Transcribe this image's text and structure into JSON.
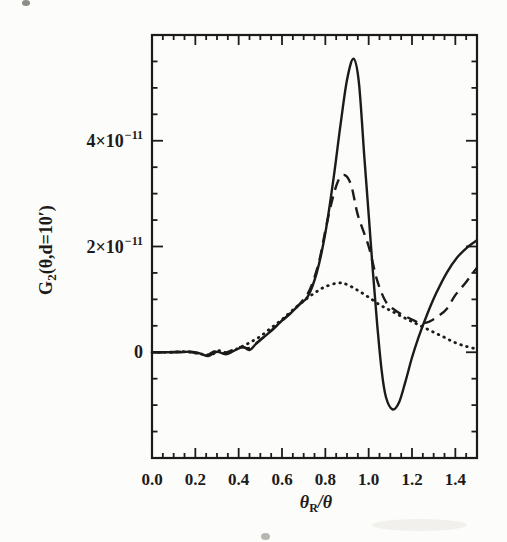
{
  "figure": {
    "background": "#fcfcfa",
    "ink_color": "#1d1b19",
    "width": 507,
    "height": 542
  },
  "chart_data": {
    "type": "line",
    "title": "",
    "xlabel": "θR/θ",
    "xlabel_parts": {
      "base": "θ",
      "sub": "R",
      "rest": "/θ"
    },
    "ylabel": "G2(θ,d=10′)",
    "ylabel_parts": {
      "base": "G",
      "sub": "2",
      "rest": "(θ,d=10′)"
    },
    "xlim": [
      0,
      1.5
    ],
    "ylim": [
      -2e-11,
      6e-11
    ],
    "y_unit_scale": 1e-11,
    "ylim_display_units": [
      -2,
      6
    ],
    "grid": false,
    "legend": "none",
    "frame": "box-with-inward-ticks",
    "x_ticks": {
      "minor_step": 0.05,
      "major_step": 0.2,
      "major": [
        {
          "v": 0.0,
          "text": "0.0"
        },
        {
          "v": 0.2,
          "text": "0.2"
        },
        {
          "v": 0.4,
          "text": "0.4"
        },
        {
          "v": 0.6,
          "text": "0.6"
        },
        {
          "v": 0.8,
          "text": "0.8"
        },
        {
          "v": 1.0,
          "text": "1.0"
        },
        {
          "v": 1.2,
          "text": "1.2"
        },
        {
          "v": 1.4,
          "text": "1.4"
        }
      ]
    },
    "y_ticks": {
      "minor_step_units": 0.5,
      "major": [
        {
          "v": 0,
          "text": "0",
          "sup": ""
        },
        {
          "v": 2,
          "text": "2×10",
          "sup": "−11"
        },
        {
          "v": 4,
          "text": "4×10",
          "sup": "−11"
        }
      ]
    },
    "series": [
      {
        "name": "solid-curve",
        "style": "solid",
        "points_unit": "1e-11",
        "points": [
          [
            0,
            0
          ],
          [
            0.06,
            0
          ],
          [
            0.12,
            0
          ],
          [
            0.18,
            0.01
          ],
          [
            0.22,
            -0.02
          ],
          [
            0.26,
            -0.07
          ],
          [
            0.3,
            0.01
          ],
          [
            0.34,
            -0.04
          ],
          [
            0.38,
            0.03
          ],
          [
            0.42,
            0.1
          ],
          [
            0.45,
            0.04
          ],
          [
            0.48,
            0.16
          ],
          [
            0.52,
            0.3
          ],
          [
            0.56,
            0.44
          ],
          [
            0.6,
            0.6
          ],
          [
            0.64,
            0.74
          ],
          [
            0.68,
            0.9
          ],
          [
            0.72,
            1.06
          ],
          [
            0.76,
            1.5
          ],
          [
            0.8,
            2.25
          ],
          [
            0.84,
            3.35
          ],
          [
            0.87,
            4.3
          ],
          [
            0.9,
            5.15
          ],
          [
            0.93,
            5.55
          ],
          [
            0.955,
            5.1
          ],
          [
            0.98,
            3.7
          ],
          [
            1.0,
            2.6
          ],
          [
            1.02,
            1.5
          ],
          [
            1.04,
            0.5
          ],
          [
            1.06,
            -0.35
          ],
          [
            1.08,
            -0.85
          ],
          [
            1.11,
            -1.08
          ],
          [
            1.14,
            -0.95
          ],
          [
            1.17,
            -0.55
          ],
          [
            1.2,
            -0.1
          ],
          [
            1.23,
            0.28
          ],
          [
            1.27,
            0.72
          ],
          [
            1.31,
            1.1
          ],
          [
            1.36,
            1.5
          ],
          [
            1.41,
            1.8
          ],
          [
            1.46,
            2.0
          ],
          [
            1.5,
            2.12
          ]
        ]
      },
      {
        "name": "dashed-curve",
        "style": "dashed",
        "points_unit": "1e-11",
        "points": [
          [
            0,
            0
          ],
          [
            0.07,
            0
          ],
          [
            0.14,
            0.01
          ],
          [
            0.2,
            -0.01
          ],
          [
            0.25,
            -0.06
          ],
          [
            0.29,
            0.02
          ],
          [
            0.33,
            -0.02
          ],
          [
            0.37,
            0.04
          ],
          [
            0.41,
            0.1
          ],
          [
            0.45,
            0.08
          ],
          [
            0.49,
            0.2
          ],
          [
            0.53,
            0.34
          ],
          [
            0.57,
            0.48
          ],
          [
            0.61,
            0.63
          ],
          [
            0.65,
            0.78
          ],
          [
            0.69,
            0.95
          ],
          [
            0.73,
            1.2
          ],
          [
            0.77,
            1.7
          ],
          [
            0.8,
            2.3
          ],
          [
            0.83,
            2.85
          ],
          [
            0.86,
            3.25
          ],
          [
            0.89,
            3.35
          ],
          [
            0.92,
            3.15
          ],
          [
            0.95,
            2.6
          ],
          [
            1.0,
            2.0
          ],
          [
            1.04,
            1.35
          ],
          [
            1.08,
            0.95
          ],
          [
            1.12,
            0.8
          ],
          [
            1.16,
            0.7
          ],
          [
            1.2,
            0.62
          ],
          [
            1.24,
            0.55
          ],
          [
            1.28,
            0.58
          ],
          [
            1.32,
            0.68
          ],
          [
            1.36,
            0.82
          ],
          [
            1.4,
            1.08
          ],
          [
            1.45,
            1.33
          ],
          [
            1.5,
            1.6
          ]
        ]
      },
      {
        "name": "dotted-curve",
        "style": "dotted",
        "points_unit": "1e-11",
        "points": [
          [
            0,
            0
          ],
          [
            0.08,
            0
          ],
          [
            0.16,
            0.01
          ],
          [
            0.22,
            -0.03
          ],
          [
            0.27,
            -0.05
          ],
          [
            0.31,
            0.03
          ],
          [
            0.35,
            -0.01
          ],
          [
            0.4,
            0.08
          ],
          [
            0.45,
            0.18
          ],
          [
            0.5,
            0.3
          ],
          [
            0.55,
            0.46
          ],
          [
            0.6,
            0.62
          ],
          [
            0.65,
            0.8
          ],
          [
            0.7,
            0.97
          ],
          [
            0.75,
            1.12
          ],
          [
            0.8,
            1.24
          ],
          [
            0.86,
            1.31
          ],
          [
            0.9,
            1.28
          ],
          [
            0.95,
            1.17
          ],
          [
            1.0,
            1.04
          ],
          [
            1.05,
            0.9
          ],
          [
            1.1,
            0.79
          ],
          [
            1.15,
            0.68
          ],
          [
            1.2,
            0.58
          ],
          [
            1.25,
            0.48
          ],
          [
            1.3,
            0.38
          ],
          [
            1.35,
            0.28
          ],
          [
            1.4,
            0.18
          ],
          [
            1.45,
            0.11
          ],
          [
            1.5,
            0.06
          ]
        ]
      }
    ]
  },
  "scan_artifacts": [
    {
      "x": 22,
      "y": 0,
      "w": 8,
      "h": 6,
      "color": "#8d8b86"
    },
    {
      "x": 261,
      "y": 533,
      "w": 9,
      "h": 7,
      "color": "#b8b5ae"
    },
    {
      "x": 372,
      "y": 519,
      "w": 95,
      "h": 12,
      "color": "#f1f0ec"
    }
  ]
}
